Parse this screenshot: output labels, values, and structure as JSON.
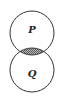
{
  "diagram": {
    "type": "venn",
    "sets": [
      {
        "label": "P",
        "cx": 32,
        "cy": 33,
        "r": 22
      },
      {
        "label": "Q",
        "cx": 32,
        "cy": 70,
        "r": 22
      }
    ],
    "shaded_region": "P ∩ Q",
    "colors": {
      "stroke": "#333333",
      "shade": "#8a8a8a",
      "background": "#ffffff"
    }
  }
}
